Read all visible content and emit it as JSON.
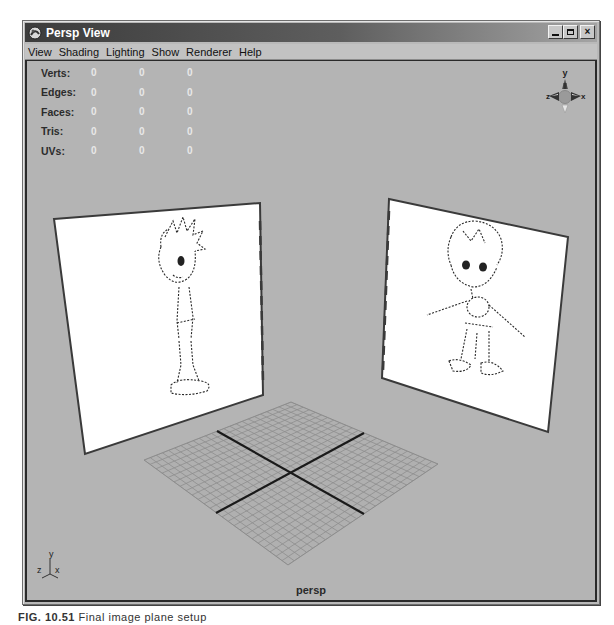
{
  "window": {
    "title": "Persp View",
    "buttons": {
      "minimize": "_",
      "maximize": "□",
      "close": "×"
    }
  },
  "menubar": {
    "items": [
      {
        "label": "View"
      },
      {
        "label": "Shading"
      },
      {
        "label": "Lighting"
      },
      {
        "label": "Show"
      },
      {
        "label": "Renderer"
      },
      {
        "label": "Help"
      }
    ]
  },
  "hud": {
    "rows": [
      {
        "label": "Verts:",
        "values": [
          "0",
          "0",
          "0"
        ]
      },
      {
        "label": "Edges:",
        "values": [
          "0",
          "0",
          "0"
        ]
      },
      {
        "label": "Faces:",
        "values": [
          "0",
          "0",
          "0"
        ]
      },
      {
        "label": "Tris:",
        "values": [
          "0",
          "0",
          "0"
        ]
      },
      {
        "label": "UVs:",
        "values": [
          "0",
          "0",
          "0"
        ]
      }
    ]
  },
  "view_cube": {
    "axis_y": "y",
    "axis_z": "z",
    "axis_x": "x"
  },
  "axis_indicator": {
    "y": "y",
    "z": "z",
    "x": "x"
  },
  "viewport": {
    "camera_label": "persp",
    "background_color": "#b4b4b4",
    "image_planes": [
      {
        "name": "side-view-reference",
        "content": "character side sketch"
      },
      {
        "name": "front-view-reference",
        "content": "character front sketch"
      }
    ],
    "grid": {
      "visible": true
    }
  },
  "caption": {
    "prefix": "FIG. 10.51",
    "text": "Final image plane setup"
  }
}
